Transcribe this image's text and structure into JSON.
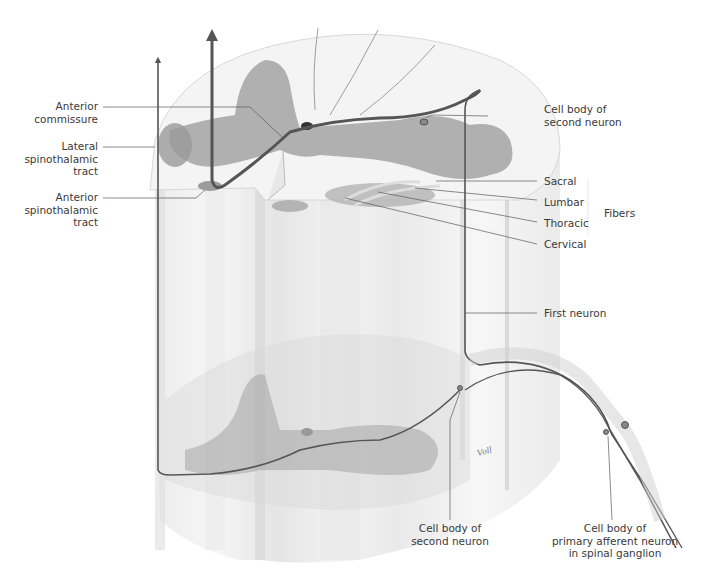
{
  "figure": {
    "signature": "Voll"
  },
  "labels": {
    "anterior_commissure": "Anterior\ncommissure",
    "lateral_spinothalamic_tract": "Lateral\nspinothalamic\ntract",
    "anterior_spinothalamic_tract": "Anterior\nspinothalamic\ntract",
    "cell_body_second_neuron_top": "Cell body of\nsecond neuron",
    "sacral": "Sacral",
    "lumbar": "Lumbar",
    "thoracic": "Thoracic",
    "cervical": "Cervical",
    "fibers": "Fibers",
    "first_neuron": "First neuron",
    "cell_body_second_neuron_bottom": "Cell body of\nsecond neuron",
    "cell_body_primary_afferent": "Cell body of\nprimary afferent neuron\nin spinal ganglion"
  },
  "colors": {
    "white_matter": "#efefef",
    "gray_matter": "#9c9c9c",
    "fiber_line": "#555555",
    "leader_line": "#5a5a5a",
    "text": "#3a3a3a"
  }
}
